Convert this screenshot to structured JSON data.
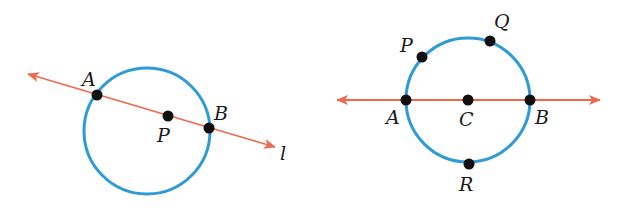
{
  "colors": {
    "circle": "#2f9bd6",
    "line": "#ef6a4c",
    "point": "#111111",
    "label": "#1a1a1a",
    "background": "#ffffff"
  },
  "figures": [
    {
      "id": "left",
      "circle": {
        "cx": 147,
        "cy": 131,
        "r": 63
      },
      "line": {
        "name": "l",
        "x1": 28,
        "y1": 74,
        "x2": 275,
        "y2": 147,
        "arrows": "both"
      },
      "points": [
        {
          "name": "A",
          "x": 97,
          "y": 95,
          "label_x": 82,
          "label_y": 86
        },
        {
          "name": "P",
          "x": 168,
          "y": 116,
          "label_x": 157,
          "label_y": 142
        },
        {
          "name": "B",
          "x": 209,
          "y": 128,
          "label_x": 214,
          "label_y": 120
        }
      ],
      "line_label": {
        "text": "l",
        "x": 280,
        "y": 160
      }
    },
    {
      "id": "right",
      "circle": {
        "cx": 468,
        "cy": 100,
        "r": 62
      },
      "line": {
        "x1": 337,
        "y1": 100,
        "x2": 600,
        "y2": 100,
        "arrows": "both"
      },
      "points": [
        {
          "name": "A",
          "x": 406,
          "y": 100,
          "label_x": 386,
          "label_y": 124
        },
        {
          "name": "C",
          "x": 468,
          "y": 100,
          "label_x": 459,
          "label_y": 126
        },
        {
          "name": "B",
          "x": 530,
          "y": 100,
          "label_x": 535,
          "label_y": 124
        },
        {
          "name": "P",
          "x": 422,
          "y": 57,
          "label_x": 400,
          "label_y": 52
        },
        {
          "name": "Q",
          "x": 490,
          "y": 41,
          "label_x": 494,
          "label_y": 28
        },
        {
          "name": "R",
          "x": 469,
          "y": 164,
          "label_x": 459,
          "label_y": 191
        }
      ]
    }
  ]
}
